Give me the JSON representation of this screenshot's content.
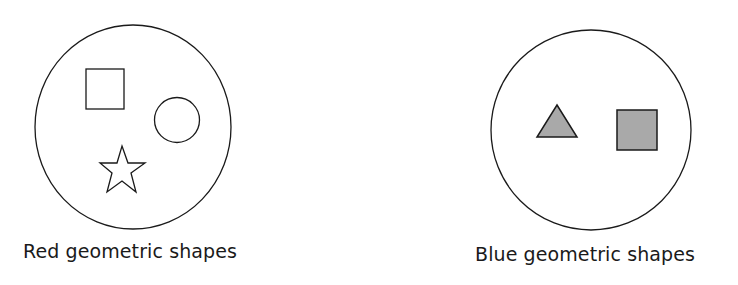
{
  "groups": [
    {
      "label": "Red geometric shapes",
      "shapes": [
        "square",
        "circle",
        "star"
      ],
      "fill": "none"
    },
    {
      "label": "Blue geometric shapes",
      "shapes": [
        "triangle",
        "square"
      ],
      "fill": "#a9a9a9"
    }
  ],
  "colors": {
    "stroke": "#1a1a1a",
    "shaded_fill": "#a9a9a9",
    "background": "#ffffff"
  }
}
